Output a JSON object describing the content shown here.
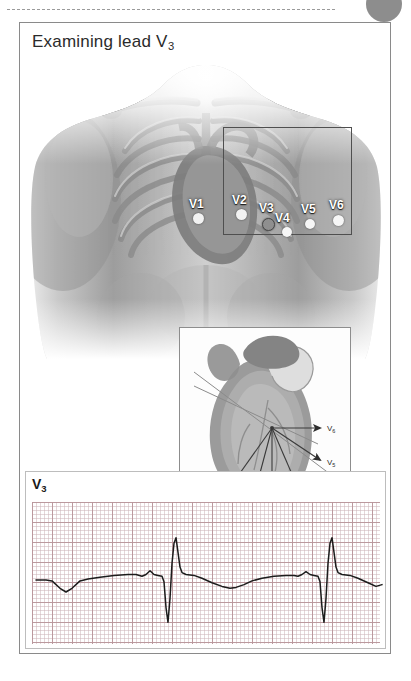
{
  "page": {
    "title": "Examining lead V3",
    "title_main": "Examining lead V",
    "title_sub": "3"
  },
  "decorations": {
    "top_rule": "dotted-rule",
    "corner_circle_color": "#8d8d8d"
  },
  "torso_figure": {
    "caption": "",
    "description": "anterior chest with ribcage and heart showing precordial electrode positions",
    "highlight_rect": "chest-region-outline",
    "electrodes": [
      {
        "label": "V1",
        "x": 174,
        "y": 190,
        "dot_x": 176,
        "dot_y": 199,
        "highlighted": false,
        "dot_color": "#f2f2f2"
      },
      {
        "label": "V2",
        "x": 216,
        "y": 186,
        "dot_x": 219,
        "dot_y": 197,
        "highlighted": false,
        "dot_color": "#f2f2f2"
      },
      {
        "label": "V3",
        "x": 243,
        "y": 194,
        "dot_x": 246,
        "dot_y": 206,
        "highlighted": true,
        "dot_color": "#8f8f8f"
      },
      {
        "label": "V4",
        "x": 259,
        "y": 203,
        "dot_x": 265,
        "dot_y": 214,
        "highlighted": false,
        "dot_color": "#f6f6f6"
      },
      {
        "label": "V5",
        "x": 285,
        "y": 195,
        "dot_x": 288,
        "dot_y": 207,
        "highlighted": false,
        "dot_color": "#f6f6f6"
      },
      {
        "label": "V6",
        "x": 313,
        "y": 191,
        "dot_x": 316,
        "dot_y": 204,
        "highlighted": false,
        "dot_color": "#f6f6f6"
      }
    ]
  },
  "inset_diagram": {
    "description": "heart in cross-section with lead vectors radiating from the electrical centre",
    "vectors": [
      {
        "label": "V1",
        "sub": "1",
        "direction": "down-left"
      },
      {
        "label": "V2",
        "sub": "2",
        "direction": "down"
      },
      {
        "label": "V3",
        "sub": "3",
        "direction": "down"
      },
      {
        "label": "V4",
        "sub": "4",
        "direction": "down-right"
      },
      {
        "label": "V5",
        "sub": "5",
        "direction": "right-down"
      },
      {
        "label": "V6",
        "sub": "6",
        "direction": "right"
      }
    ]
  },
  "ecg": {
    "lead_label_main": "V",
    "lead_label_sub": "3",
    "lead_label": "V3",
    "grid": {
      "small_square_px": 4,
      "large_square_px": 20,
      "major_color": "#b9969b",
      "minor_color": "#ceb6ba"
    },
    "trace_color": "#1c1c1c",
    "beats": 3,
    "morphology": "equiphasic RS complex with tall narrow R wave, deep S wave and upright T wave"
  },
  "chart_data": {
    "type": "line",
    "xlabel": "time",
    "ylabel": "amplitude (mV)",
    "series": [
      {
        "name": "V3",
        "points": [
          [
            0,
            0
          ],
          [
            10,
            0
          ],
          [
            16,
            -1
          ],
          [
            24,
            -9
          ],
          [
            30,
            -13
          ],
          [
            36,
            -9
          ],
          [
            44,
            -1
          ],
          [
            52,
            1
          ],
          [
            64,
            3
          ],
          [
            78,
            5
          ],
          [
            92,
            6
          ],
          [
            100,
            6
          ],
          [
            106,
            4
          ],
          [
            110,
            6
          ],
          [
            114,
            10
          ],
          [
            118,
            6
          ],
          [
            122,
            5
          ],
          [
            126,
            4
          ],
          [
            128,
            -2
          ],
          [
            130,
            -30
          ],
          [
            132,
            -46
          ],
          [
            134,
            -20
          ],
          [
            136,
            18
          ],
          [
            138,
            40
          ],
          [
            140,
            46
          ],
          [
            142,
            30
          ],
          [
            144,
            14
          ],
          [
            146,
            8
          ],
          [
            150,
            6
          ],
          [
            158,
            5
          ],
          [
            166,
            2
          ],
          [
            176,
            -3
          ],
          [
            186,
            -7
          ],
          [
            194,
            -9
          ],
          [
            200,
            -8
          ],
          [
            208,
            -5
          ],
          [
            216,
            -1
          ],
          [
            226,
            2
          ],
          [
            238,
            4
          ],
          [
            250,
            5
          ],
          [
            258,
            5
          ],
          [
            262,
            4
          ],
          [
            266,
            6
          ],
          [
            270,
            9
          ],
          [
            274,
            6
          ],
          [
            278,
            5
          ],
          [
            282,
            4
          ],
          [
            284,
            -2
          ],
          [
            286,
            -30
          ],
          [
            288,
            -46
          ],
          [
            290,
            -20
          ],
          [
            292,
            18
          ],
          [
            294,
            40
          ],
          [
            296,
            46
          ],
          [
            298,
            30
          ],
          [
            300,
            14
          ],
          [
            302,
            8
          ],
          [
            306,
            6
          ],
          [
            314,
            5
          ],
          [
            322,
            2
          ],
          [
            332,
            -3
          ],
          [
            340,
            -7
          ],
          [
            346,
            -5
          ]
        ]
      }
    ],
    "ylim": [
      -50,
      50
    ],
    "xlim": [
      0,
      348
    ],
    "grid": true,
    "legend": "none"
  }
}
